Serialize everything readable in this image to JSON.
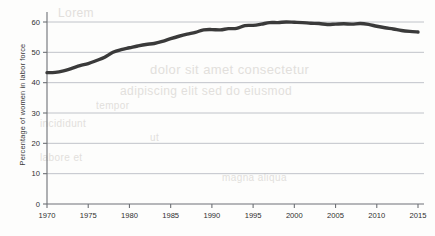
{
  "chart_data": {
    "type": "line",
    "title": "",
    "xlabel": "",
    "ylabel": "Percentage of women in labor force",
    "xlim": [
      1970,
      2015
    ],
    "ylim": [
      0,
      60
    ],
    "grid": true,
    "legend": null,
    "xticks": [
      "1970",
      "1975",
      "1980",
      "1985",
      "1990",
      "1995",
      "2000",
      "2005",
      "2010",
      "2015"
    ],
    "yticks": [
      "0",
      "10",
      "20",
      "30",
      "40",
      "50",
      "60"
    ],
    "line_color": "#3a3a3a",
    "series": [
      {
        "name": "Percentage of women in labor force",
        "x": [
          1970,
          1971,
          1972,
          1973,
          1974,
          1975,
          1976,
          1977,
          1978,
          1979,
          1980,
          1981,
          1982,
          1983,
          1984,
          1985,
          1986,
          1987,
          1988,
          1989,
          1990,
          1991,
          1992,
          1993,
          1994,
          1995,
          1996,
          1997,
          1998,
          1999,
          2000,
          2001,
          2002,
          2003,
          2004,
          2005,
          2006,
          2007,
          2008,
          2009,
          2010,
          2011,
          2012,
          2013,
          2014,
          2015
        ],
        "values": [
          43.3,
          43.4,
          43.9,
          44.7,
          45.6,
          46.3,
          47.3,
          48.4,
          50.0,
          50.9,
          51.5,
          52.1,
          52.6,
          52.9,
          53.6,
          54.5,
          55.3,
          56.0,
          56.6,
          57.4,
          57.5,
          57.4,
          57.8,
          57.9,
          58.8,
          58.9,
          59.3,
          59.8,
          59.8,
          60.0,
          59.9,
          59.8,
          59.6,
          59.5,
          59.2,
          59.3,
          59.4,
          59.3,
          59.5,
          59.2,
          58.6,
          58.1,
          57.7,
          57.2,
          56.9,
          56.7
        ]
      }
    ]
  },
  "bleed_text": {
    "line1": "Lorem",
    "line2": "dolor sit amet consectetur",
    "line3": "adipiscing elit sed do eiusmod",
    "line4": "tempor",
    "line5": "incididunt",
    "line6": "ut",
    "line7": "labore et",
    "line8": "magna aliqua"
  }
}
